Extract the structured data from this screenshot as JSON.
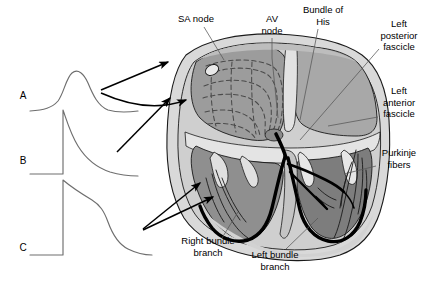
{
  "figure": {
    "background_color": "#ffffff"
  },
  "palette": {
    "outline": "#1a1a1a",
    "pericardium": "#d9d9d9",
    "myocardium_light": "#cfcfcf",
    "myocardium_mid": "#a8a8a8",
    "chamber_dark": "#8f8f8f",
    "chamber_darker": "#7d7d7d",
    "atrium_gray": "#9c9c9c",
    "conduction_black": "#000000",
    "trace_line": "#6e6e6e",
    "leader_line": "#555555",
    "arrow_black": "#000000"
  },
  "traces": [
    {
      "id": "A",
      "label": "A",
      "label_x": 23,
      "label_y": 99,
      "description": "SA nodal pacemaker potential - slow rounded upstroke and decay",
      "path": "M 30 111 C 44 110 52 108 58 101 C 64 93 66 78 72 73 C 78 68 84 74 88 83 C 93 95 98 106 108 110 C 118 113 130 112 138 111"
    },
    {
      "id": "B",
      "label": "B",
      "label_x": 23,
      "label_y": 164,
      "description": "Atrial / His-Purkinje fast response action potential - rapid upstroke, gradual repolarization",
      "path": "M 30 174 L 63 174 L 63 110 C 66 118 70 133 78 146 C 86 159 98 168 110 172 C 120 175 130 176 138 176"
    },
    {
      "id": "C",
      "label": "C",
      "label_x": 23,
      "label_y": 251,
      "description": "Ventricular muscle action potential - rapid upstroke, long plateau, steep repolarization",
      "path": "M 30 255 L 63 255 L 63 180 C 70 186 82 194 92 200 C 100 205 104 211 108 222 C 112 233 118 244 128 249 C 136 253 144 255 152 255"
    }
  ],
  "labels": [
    {
      "id": "sa-node",
      "text_lines": [
        "SA node"
      ],
      "x": 196,
      "y": 22,
      "anchor": "middle",
      "leader": "M 204 27 L 224 60"
    },
    {
      "id": "av-node",
      "text_lines": [
        "AV",
        "node"
      ],
      "x": 272,
      "y": 22,
      "anchor": "middle",
      "leader": "M 272 38 L 272 58 L 278 118"
    },
    {
      "id": "bundle-of-his",
      "text_lines": [
        "Bundle of",
        "His"
      ],
      "x": 323,
      "y": 13,
      "anchor": "middle",
      "leader": "M 318 29 L 300 120"
    },
    {
      "id": "left-posterior-fascicle",
      "text_lines": [
        "Left",
        "posterior",
        "fascicle"
      ],
      "x": 399,
      "y": 27,
      "anchor": "middle",
      "leader": "M 379 49 L 300 140"
    },
    {
      "id": "left-anterior-fascicle",
      "text_lines": [
        "Left",
        "anterior",
        "fascicle"
      ],
      "x": 399,
      "y": 94,
      "anchor": "middle",
      "leader": "M 378 117 L 328 126"
    },
    {
      "id": "purkinje-fibers",
      "text_lines": [
        "Purkinje",
        "fibers"
      ],
      "x": 399,
      "y": 156,
      "anchor": "middle",
      "leader": "M 376 166 L 344 174"
    },
    {
      "id": "right-bundle-branch",
      "text_lines": [
        "Right bundle",
        "branch"
      ],
      "x": 208,
      "y": 244,
      "anchor": "middle",
      "leader": "M 222 238 L 238 212"
    },
    {
      "id": "left-bundle-branch",
      "text_lines": [
        "Left bundle",
        "branch"
      ],
      "x": 275,
      "y": 258,
      "anchor": "middle",
      "leader": "M 286 249 L 318 218"
    }
  ],
  "arrows": [
    {
      "id": "arrow-a-upper",
      "from_trace": "A",
      "path": "M 101 90 L 168 62",
      "description": "From trace A to SA node region"
    },
    {
      "id": "arrow-a-lower",
      "from_trace": "A",
      "path": "M 101 93 C 130 106 160 110 186 100",
      "description": "From trace A curving into right atrium internodal tracts"
    },
    {
      "id": "arrow-b",
      "from_trace": "B",
      "path": "M 117 152 L 170 98",
      "description": "From trace B to atrial wall"
    },
    {
      "id": "arrow-c-upper",
      "from_trace": "C",
      "path": "M 143 229 L 200 183",
      "description": "From trace C to ventricular wall"
    },
    {
      "id": "arrow-c-lower",
      "from_trace": "C",
      "path": "M 143 230 L 213 197",
      "description": "From trace C to right bundle branch region"
    }
  ],
  "anatomy": {
    "structures": [
      "pericardial outline",
      "right atrium",
      "left atrium",
      "right ventricle",
      "left ventricle",
      "interventricular septum",
      "atrioventricular valves",
      "internodal dashed pathways",
      "bundle of His",
      "right bundle branch",
      "left bundle branch",
      "left anterior fascicle",
      "left posterior fascicle",
      "purkinje fiber network"
    ]
  }
}
